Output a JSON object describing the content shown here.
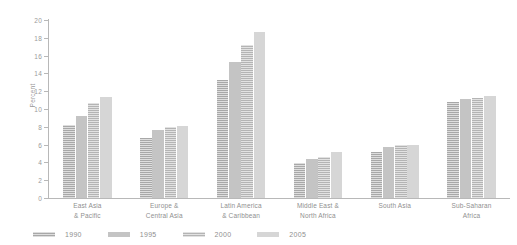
{
  "chart_data": {
    "type": "bar",
    "title": "",
    "subtitle": "",
    "xlabel": "",
    "ylabel": "Percent",
    "ylim": [
      0,
      20
    ],
    "ytick_step": 2,
    "yticks": [
      0,
      2,
      4,
      6,
      8,
      10,
      12,
      14,
      16,
      18,
      20
    ],
    "ytick_labels": [
      "0",
      "2",
      "4",
      "6",
      "8",
      "10",
      "12",
      "14",
      "16",
      "18",
      "20"
    ],
    "grid": false,
    "legend_position": "bottom-left",
    "orientation": "vertical",
    "grouping": "grouped",
    "categories": [
      "East Asia\n& Pacific",
      "Europe &\nCentral Asia",
      "Latin America\n& Caribbean",
      "Middle East &\nNorth Africa",
      "South Asia",
      "Sub-Saharan\nAfrica"
    ],
    "category_lines": [
      [
        "East Asia",
        "& Pacific"
      ],
      [
        "Europe &",
        "Central Asia"
      ],
      [
        "Latin America",
        "& Caribbean"
      ],
      [
        "Middle East &",
        "North Africa"
      ],
      [
        "South Asia",
        ""
      ],
      [
        "Sub-Saharan",
        "Africa"
      ]
    ],
    "series": [
      {
        "name": "1990",
        "color": "#a8a8a8",
        "pattern": "horizontal-hatch",
        "values": [
          8.2,
          6.7,
          13.3,
          3.9,
          5.2,
          10.8
        ]
      },
      {
        "name": "1995",
        "color": "#c4c4c4",
        "pattern": "solid",
        "values": [
          9.2,
          7.6,
          15.3,
          4.4,
          5.7,
          11.1
        ]
      },
      {
        "name": "2000",
        "color": "#b4b4b4",
        "pattern": "horizontal-hatch",
        "values": [
          10.7,
          8.0,
          17.2,
          4.6,
          6.0,
          11.2
        ]
      },
      {
        "name": "2005",
        "color": "#d6d6d6",
        "pattern": "solid",
        "values": [
          11.4,
          8.1,
          18.7,
          5.2,
          6.0,
          11.5
        ]
      }
    ]
  },
  "legend": {
    "items": [
      {
        "label": "1990"
      },
      {
        "label": "1995"
      },
      {
        "label": "2000"
      },
      {
        "label": "2005"
      }
    ]
  },
  "axes": {
    "y_title": "Percent"
  },
  "colors": {
    "axis": "#b8b8b8",
    "text": "#8f8f8f",
    "background": "#ffffff"
  }
}
